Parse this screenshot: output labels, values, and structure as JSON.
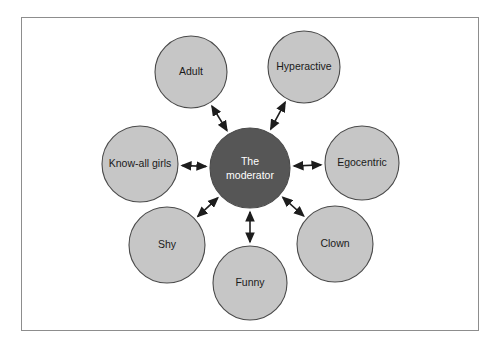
{
  "figure": {
    "type": "hub-and-spoke-diagram",
    "border_color": "#8d8d8d",
    "background": "#ffffff"
  },
  "center": {
    "id": "the-moderator",
    "label_line1": "The",
    "label_line2": "moderator",
    "fill": "#565656",
    "text_color": "#ffffff",
    "cx": 250,
    "cy": 168,
    "r": 40
  },
  "nodes": [
    {
      "id": "adult",
      "label": "Adult",
      "fill": "#c6c6c6",
      "text_color": "#1a1a1a",
      "cx": 191,
      "cy": 72,
      "r": 36
    },
    {
      "id": "hyperactive",
      "label": "Hyperactive",
      "fill": "#c6c6c6",
      "text_color": "#1a1a1a",
      "cx": 304,
      "cy": 67,
      "r": 36
    },
    {
      "id": "egocentric",
      "label": "Egocentric",
      "fill": "#c6c6c6",
      "text_color": "#1a1a1a",
      "cx": 362,
      "cy": 163,
      "r": 37
    },
    {
      "id": "clown",
      "label": "Clown",
      "fill": "#c6c6c6",
      "text_color": "#1a1a1a",
      "cx": 335,
      "cy": 244,
      "r": 38
    },
    {
      "id": "funny",
      "label": "Funny",
      "fill": "#c6c6c6",
      "text_color": "#1a1a1a",
      "cx": 250,
      "cy": 283,
      "r": 37
    },
    {
      "id": "shy",
      "label": "Shy",
      "fill": "#c6c6c6",
      "text_color": "#1a1a1a",
      "cx": 167,
      "cy": 245,
      "r": 38
    },
    {
      "id": "know-all-girls",
      "label": "Know-all girls",
      "fill": "#c6c6c6",
      "text_color": "#1a1a1a",
      "cx": 140,
      "cy": 164,
      "r": 38
    }
  ],
  "connectors": {
    "style": "double-headed-arrow",
    "color": "#1d1d1d",
    "links": [
      {
        "from": "the-moderator",
        "to": "adult"
      },
      {
        "from": "the-moderator",
        "to": "hyperactive"
      },
      {
        "from": "the-moderator",
        "to": "egocentric"
      },
      {
        "from": "the-moderator",
        "to": "clown"
      },
      {
        "from": "the-moderator",
        "to": "funny"
      },
      {
        "from": "the-moderator",
        "to": "shy"
      },
      {
        "from": "the-moderator",
        "to": "know-all-girls"
      }
    ]
  }
}
